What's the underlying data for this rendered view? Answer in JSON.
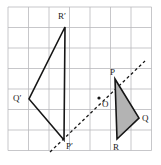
{
  "figure": {
    "canvas": {
      "width": 161,
      "height": 165,
      "background": "#ffffff"
    },
    "grid": {
      "visible": true,
      "origin_x": 8,
      "origin_y": 7,
      "cell": 20.5,
      "cols": 7,
      "rows": 7,
      "color": "#b9b9bd",
      "line_width": 0.8
    },
    "style": {
      "stroke_color": "#161616",
      "solid_width": 1.6,
      "dashed_width": 1.3,
      "dash_pattern": "3,2.6",
      "shade_fill": "#b3b3b3",
      "label_color": "#1a1a1a",
      "label_font_size": "9px",
      "point_dot_radius": 1.6
    },
    "axis_line": {
      "name": "reflection-axis",
      "dashed": true,
      "from": {
        "x": 50,
        "y": 152
      },
      "to": {
        "x": 145,
        "y": 61
      }
    },
    "shapes": [
      {
        "name": "triangle-pqr",
        "shaded": true,
        "closed": true,
        "points": [
          {
            "x": 115,
            "y": 79
          },
          {
            "x": 139,
            "y": 118
          },
          {
            "x": 117,
            "y": 139
          }
        ]
      },
      {
        "name": "triangle-p-prime-q-prime-r-prime",
        "shaded": false,
        "closed": true,
        "points": [
          {
            "x": 64,
            "y": 140
          },
          {
            "x": 29,
            "y": 99
          },
          {
            "x": 65,
            "y": 27
          }
        ]
      }
    ],
    "center_point": {
      "name": "centre-o",
      "x": 99,
      "y": 98
    },
    "labels": [
      {
        "name": "vertex-label-r-prime",
        "text": "R′",
        "x": 58,
        "y": 12
      },
      {
        "name": "vertex-label-q-prime",
        "text": "Q′",
        "x": 13,
        "y": 94
      },
      {
        "name": "vertex-label-p-prime",
        "text": "P′",
        "x": 66,
        "y": 142
      },
      {
        "name": "vertex-label-p",
        "text": "P",
        "x": 110,
        "y": 68
      },
      {
        "name": "vertex-label-o",
        "text": "O",
        "x": 102,
        "y": 100
      },
      {
        "name": "vertex-label-q",
        "text": "Q",
        "x": 142,
        "y": 114
      },
      {
        "name": "vertex-label-r",
        "text": "R",
        "x": 113,
        "y": 143
      }
    ]
  }
}
